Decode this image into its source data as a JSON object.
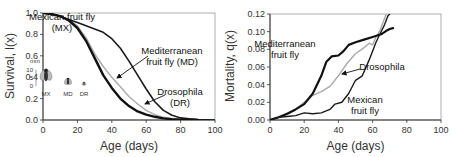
{
  "chart_data": [
    {
      "type": "line",
      "title": "",
      "xlabel": "Age (days)",
      "ylabel": "Survival, l(x)",
      "xlim": [
        0,
        100
      ],
      "ylim": [
        0,
        1.0
      ],
      "xticks": [
        0,
        20,
        40,
        60,
        80,
        100
      ],
      "yticks": [
        0.0,
        0.2,
        0.4,
        0.6,
        0.8,
        1.0
      ],
      "ytick_labels": [
        "0.0",
        "0.2",
        "0.4",
        "0.6",
        "0.8",
        "1.0"
      ],
      "grid": false,
      "series": [
        {
          "name": "Mexican fruit fly (MX)",
          "color": "#1a1a1a",
          "width": 1.6,
          "x": [
            0,
            5,
            10,
            15,
            20,
            25,
            30,
            35,
            40,
            45,
            50,
            55,
            60,
            65,
            70,
            75,
            80,
            85,
            90,
            95,
            100
          ],
          "y": [
            1.0,
            0.99,
            0.97,
            0.94,
            0.91,
            0.88,
            0.85,
            0.82,
            0.76,
            0.67,
            0.55,
            0.42,
            0.29,
            0.17,
            0.09,
            0.045,
            0.02,
            0.01,
            0.005,
            0.002,
            0.0
          ]
        },
        {
          "name": "Mediterranean fruit fly (MD)",
          "color": "#111111",
          "width": 2.4,
          "x": [
            0,
            5,
            10,
            15,
            20,
            25,
            30,
            35,
            40,
            45,
            50,
            55,
            60,
            65,
            70,
            75,
            80,
            85,
            90
          ],
          "y": [
            1.0,
            0.99,
            0.97,
            0.93,
            0.86,
            0.74,
            0.58,
            0.42,
            0.3,
            0.2,
            0.13,
            0.08,
            0.05,
            0.03,
            0.015,
            0.008,
            0.004,
            0.002,
            0.0
          ]
        },
        {
          "name": "Drosophila (DR)",
          "color": "#aaaaaa",
          "width": 1.4,
          "x": [
            0,
            5,
            10,
            15,
            20,
            25,
            30,
            35,
            40,
            45,
            50,
            55,
            60,
            65,
            70,
            75,
            80,
            85,
            90
          ],
          "y": [
            1.0,
            0.99,
            0.97,
            0.94,
            0.88,
            0.77,
            0.62,
            0.5,
            0.4,
            0.31,
            0.22,
            0.15,
            0.09,
            0.05,
            0.025,
            0.012,
            0.005,
            0.002,
            0.0
          ]
        }
      ],
      "annotations": [
        {
          "text": [
            "Mexican fruit fly",
            "(MX)"
          ],
          "x": 62,
          "y": 20
        },
        {
          "text": [
            "Mediterranean",
            "fruit fly (MD)"
          ],
          "x": 172,
          "y": 54
        },
        {
          "text": [
            "Drosophila",
            "(DR)"
          ],
          "x": 180,
          "y": 95
        }
      ],
      "inset": {
        "unit": "mm",
        "scale_ticks": [
          "10",
          "5",
          "0"
        ],
        "labels": [
          "MX",
          "MD",
          "DR"
        ]
      }
    },
    {
      "type": "line",
      "title": "",
      "xlabel": "Age (days)",
      "ylabel": "Mortality, q(x)",
      "xlim": [
        0,
        100
      ],
      "ylim": [
        0,
        0.12
      ],
      "xticks": [
        0,
        20,
        40,
        60,
        80,
        100
      ],
      "yticks": [
        0.0,
        0.02,
        0.04,
        0.06,
        0.08,
        0.1,
        0.12
      ],
      "ytick_labels": [
        "0.00",
        "0.02",
        "0.04",
        "0.06",
        "0.08",
        "0.10",
        "0.12"
      ],
      "grid": false,
      "series": [
        {
          "name": "Mediterranean fruit fly",
          "color": "#111111",
          "width": 2.2,
          "x": [
            0,
            5,
            10,
            15,
            20,
            25,
            30,
            33,
            36,
            40,
            43,
            46,
            50,
            55,
            60,
            65,
            68,
            70,
            72
          ],
          "y": [
            0.0,
            0.003,
            0.007,
            0.012,
            0.018,
            0.03,
            0.05,
            0.066,
            0.072,
            0.073,
            0.078,
            0.085,
            0.088,
            0.091,
            0.094,
            0.097,
            0.101,
            0.103,
            0.104
          ]
        },
        {
          "name": "Drosophila",
          "color": "#aaaaaa",
          "width": 1.4,
          "x": [
            0,
            5,
            10,
            15,
            20,
            25,
            30,
            35,
            40,
            45,
            50,
            55,
            58,
            60,
            62,
            64,
            66,
            68
          ],
          "y": [
            0.0,
            0.003,
            0.006,
            0.012,
            0.02,
            0.028,
            0.032,
            0.038,
            0.05,
            0.064,
            0.075,
            0.082,
            0.087,
            0.085,
            0.094,
            0.1,
            0.11,
            0.12
          ]
        },
        {
          "name": "Mexican fruit fly",
          "color": "#1a1a1a",
          "width": 1.4,
          "x": [
            0,
            5,
            10,
            15,
            20,
            25,
            30,
            35,
            38,
            42,
            46,
            50,
            54,
            58,
            62,
            65,
            67,
            69,
            70
          ],
          "y": [
            0.0,
            0.003,
            0.004,
            0.005,
            0.008,
            0.007,
            0.008,
            0.012,
            0.018,
            0.02,
            0.03,
            0.045,
            0.05,
            0.068,
            0.088,
            0.1,
            0.108,
            0.118,
            0.12
          ]
        }
      ],
      "annotations": [
        {
          "text": [
            "Mediterranean",
            "fruit fly"
          ],
          "x": 285,
          "y": 47
        },
        {
          "text": [
            "Drosophila"
          ],
          "x": 382,
          "y": 70
        },
        {
          "text": [
            "Mexican",
            "fruit fly"
          ],
          "x": 365,
          "y": 103
        }
      ]
    }
  ]
}
